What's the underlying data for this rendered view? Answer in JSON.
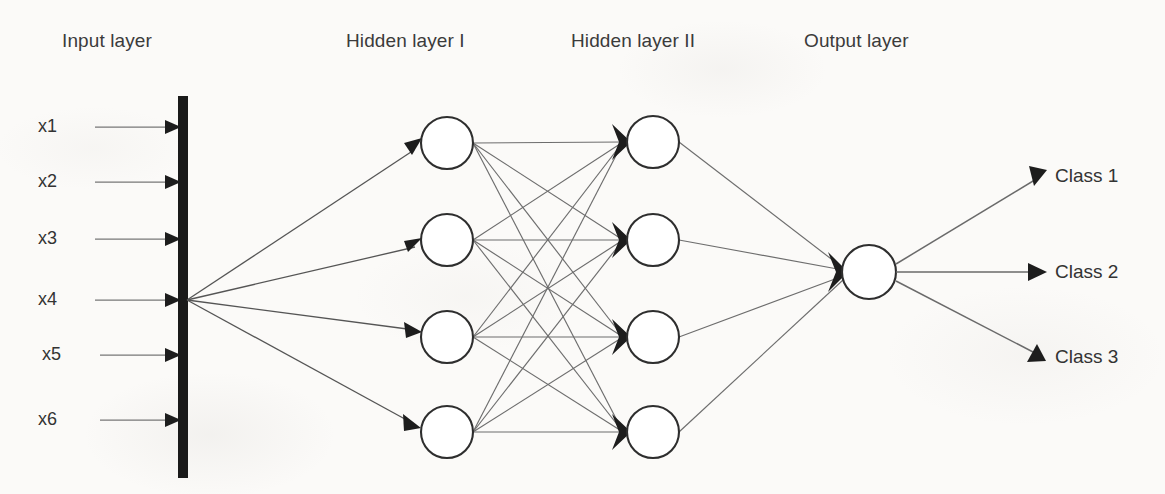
{
  "diagram": {
    "background_color": "#fbfaf8",
    "stroke_color": "#2e2e2e",
    "edge_color": "#6d6d6d"
  },
  "layer_labels": {
    "input": "Input layer",
    "hidden1": "Hidden layer I",
    "hidden2": "Hidden layer II",
    "output": "Output layer"
  },
  "inputs": [
    {
      "label": "x1"
    },
    {
      "label": "x2"
    },
    {
      "label": "x3"
    },
    {
      "label": "x4"
    },
    {
      "label": "x5"
    },
    {
      "label": "x6"
    }
  ],
  "hidden_layer_1": {
    "node_count": 4,
    "nodes": [
      {
        "label": ""
      },
      {
        "label": ""
      },
      {
        "label": ""
      },
      {
        "label": ""
      }
    ]
  },
  "hidden_layer_2": {
    "node_count": 4,
    "nodes": [
      {
        "label": ""
      },
      {
        "label": ""
      },
      {
        "label": ""
      },
      {
        "label": ""
      }
    ]
  },
  "output_layer": {
    "node_count": 1,
    "nodes": [
      {
        "label": ""
      }
    ]
  },
  "classes": [
    {
      "label": "Class 1"
    },
    {
      "label": "Class 2"
    },
    {
      "label": "Class 3"
    }
  ],
  "icons": {
    "input_bus": "vertical-bar-icon",
    "arrow": "arrowhead-icon",
    "neuron": "circle-node-icon"
  }
}
